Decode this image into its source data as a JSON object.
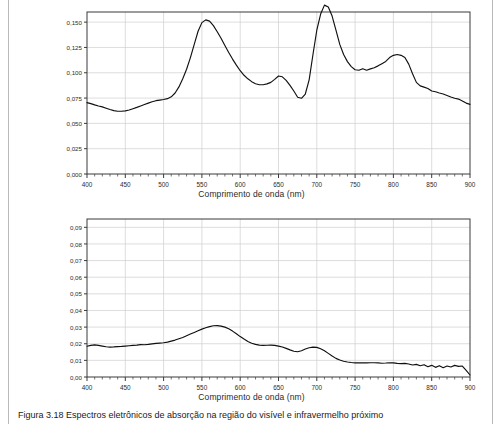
{
  "page": {
    "caption_label": "Figura 3.18",
    "caption_text": "Figura 3.18 Espectros eletrônicos de absorção na região do visível e infravermelho próximo"
  },
  "chart_data": [
    {
      "type": "line",
      "id": "top-spectrum",
      "title": "",
      "xlabel": "Comprimento de onda (nm)",
      "ylabel": "",
      "xlim": [
        400,
        900
      ],
      "ylim": [
        0.0,
        0.16
      ],
      "grid": true,
      "legend": null,
      "xticks": [
        400,
        450,
        500,
        550,
        600,
        650,
        700,
        750,
        800,
        850,
        900
      ],
      "xtick_labels": [
        "400",
        "450",
        "500",
        "550",
        "600",
        "650",
        "700",
        "750",
        "800",
        "850",
        "900"
      ],
      "yticks": [
        0.0,
        0.025,
        0.05,
        0.075,
        0.1,
        0.125,
        0.15
      ],
      "ytick_labels": [
        "0,000",
        "0,025",
        "0,050",
        "0,075",
        "0,100",
        "0,125",
        "0,150"
      ],
      "minor_xtick_step": 10,
      "line_color": "#101010",
      "x": [
        400,
        405,
        410,
        415,
        420,
        425,
        430,
        435,
        440,
        445,
        450,
        455,
        460,
        465,
        470,
        475,
        480,
        485,
        490,
        495,
        500,
        505,
        510,
        515,
        520,
        525,
        530,
        535,
        540,
        545,
        550,
        555,
        560,
        565,
        570,
        575,
        580,
        585,
        590,
        595,
        600,
        605,
        610,
        615,
        620,
        625,
        630,
        635,
        640,
        645,
        650,
        655,
        660,
        665,
        670,
        675,
        680,
        685,
        690,
        695,
        700,
        705,
        710,
        715,
        720,
        725,
        730,
        735,
        740,
        745,
        750,
        755,
        760,
        765,
        770,
        775,
        780,
        785,
        790,
        795,
        800,
        805,
        810,
        815,
        820,
        825,
        830,
        835,
        840,
        845,
        850,
        855,
        860,
        865,
        870,
        875,
        880,
        885,
        890,
        895,
        900
      ],
      "values": [
        0.0705,
        0.0695,
        0.0683,
        0.0672,
        0.0663,
        0.065,
        0.0637,
        0.0626,
        0.062,
        0.062,
        0.0624,
        0.0632,
        0.0645,
        0.0658,
        0.0672,
        0.0686,
        0.07,
        0.0714,
        0.0724,
        0.073,
        0.0736,
        0.0744,
        0.0762,
        0.08,
        0.086,
        0.094,
        0.1035,
        0.115,
        0.128,
        0.141,
        0.1495,
        0.1522,
        0.151,
        0.1465,
        0.1405,
        0.134,
        0.127,
        0.12,
        0.1135,
        0.1075,
        0.102,
        0.0975,
        0.094,
        0.0912,
        0.0892,
        0.0882,
        0.0882,
        0.089,
        0.0905,
        0.0935,
        0.0968,
        0.096,
        0.0925,
        0.0875,
        0.082,
        0.0758,
        0.0748,
        0.079,
        0.093,
        0.118,
        0.142,
        0.158,
        0.1668,
        0.165,
        0.156,
        0.142,
        0.128,
        0.118,
        0.111,
        0.106,
        0.103,
        0.1025,
        0.104,
        0.1025,
        0.1038,
        0.105,
        0.1068,
        0.109,
        0.1112,
        0.115,
        0.1172,
        0.118,
        0.1172,
        0.115,
        0.1085,
        0.099,
        0.0905,
        0.087,
        0.0858,
        0.0845,
        0.082,
        0.0812,
        0.08,
        0.079,
        0.0775,
        0.076,
        0.0748,
        0.074,
        0.0722,
        0.07,
        0.0688,
        0.07
      ]
    },
    {
      "type": "line",
      "id": "bottom-spectrum",
      "title": "",
      "xlabel": "Comprimento de onda (nm)",
      "ylabel": "",
      "xlim": [
        400,
        900
      ],
      "ylim": [
        0.0,
        0.095
      ],
      "grid": true,
      "legend": null,
      "xticks": [
        400,
        450,
        500,
        550,
        600,
        650,
        700,
        750,
        800,
        850,
        900
      ],
      "xtick_labels": [
        "400",
        "450",
        "500",
        "550",
        "600",
        "650",
        "700",
        "750",
        "800",
        "850",
        "900"
      ],
      "yticks": [
        0.0,
        0.01,
        0.02,
        0.03,
        0.04,
        0.05,
        0.06,
        0.07,
        0.08,
        0.09
      ],
      "ytick_labels": [
        "0,00",
        "0,01",
        "0,02",
        "0,03",
        "0,04",
        "0,05",
        "0,06",
        "0,07",
        "0,08",
        "0,09"
      ],
      "minor_xtick_step": 10,
      "line_color": "#101010",
      "x": [
        400,
        405,
        410,
        415,
        420,
        425,
        430,
        435,
        440,
        445,
        450,
        455,
        460,
        465,
        470,
        475,
        480,
        485,
        490,
        495,
        500,
        505,
        510,
        515,
        520,
        525,
        530,
        535,
        540,
        545,
        550,
        555,
        560,
        565,
        570,
        575,
        580,
        585,
        590,
        595,
        600,
        605,
        610,
        615,
        620,
        625,
        630,
        635,
        640,
        645,
        650,
        655,
        660,
        665,
        670,
        675,
        680,
        685,
        690,
        695,
        700,
        705,
        710,
        715,
        720,
        725,
        730,
        735,
        740,
        745,
        750,
        755,
        760,
        765,
        770,
        775,
        780,
        785,
        790,
        795,
        800,
        805,
        810,
        815,
        820,
        825,
        830,
        835,
        840,
        845,
        850,
        855,
        860,
        865,
        870,
        875,
        880,
        885,
        890,
        895,
        900
      ],
      "values": [
        0.0185,
        0.019,
        0.0193,
        0.019,
        0.0186,
        0.0182,
        0.018,
        0.0181,
        0.0183,
        0.0184,
        0.0186,
        0.0188,
        0.019,
        0.0192,
        0.0195,
        0.0194,
        0.0196,
        0.0199,
        0.0202,
        0.0204,
        0.0206,
        0.021,
        0.0216,
        0.0222,
        0.023,
        0.0238,
        0.0248,
        0.0258,
        0.0268,
        0.0278,
        0.0288,
        0.0296,
        0.0303,
        0.0308,
        0.0309,
        0.0306,
        0.03,
        0.029,
        0.0276,
        0.026,
        0.0243,
        0.0228,
        0.0214,
        0.0203,
        0.0196,
        0.0192,
        0.019,
        0.0191,
        0.0192,
        0.019,
        0.0186,
        0.018,
        0.0172,
        0.0163,
        0.0155,
        0.0152,
        0.0158,
        0.0168,
        0.0176,
        0.018,
        0.0178,
        0.017,
        0.0158,
        0.0142,
        0.0126,
        0.0112,
        0.0102,
        0.0095,
        0.009,
        0.0087,
        0.0085,
        0.0085,
        0.0086,
        0.0085,
        0.0086,
        0.0086,
        0.0085,
        0.0083,
        0.0084,
        0.0086,
        0.0085,
        0.0082,
        0.008,
        0.0082,
        0.0078,
        0.0072,
        0.0076,
        0.0068,
        0.0074,
        0.0062,
        0.007,
        0.0058,
        0.0068,
        0.0056,
        0.0066,
        0.006,
        0.007,
        0.0064,
        0.0066,
        0.004,
        0.0012
      ]
    }
  ]
}
